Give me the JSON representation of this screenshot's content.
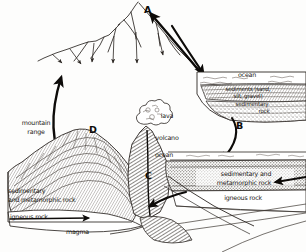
{
  "diagram": {
    "type": "hand-drawn geology cross-section",
    "stage": {
      "width": 306,
      "height": 252
    },
    "ink_color": "#191512",
    "paper_color": "#fdfdfc"
  },
  "keys": [
    {
      "id": "A",
      "label": "A",
      "x": 146,
      "y": 6,
      "desc": "erosion and transport of sediment to ocean"
    },
    {
      "id": "B",
      "label": "B",
      "x": 238,
      "y": 125,
      "desc": "burial and lithification into sedimentary rock"
    },
    {
      "id": "C",
      "label": "C",
      "x": 147,
      "y": 175,
      "desc": "subduction of crust toward magma"
    },
    {
      "id": "D",
      "label": "D",
      "x": 91,
      "y": 127,
      "desc": "uplift of mountain range"
    }
  ],
  "labels": [
    {
      "name": "ocean-upper",
      "text": "ocean",
      "x": 247,
      "y": 75,
      "size": "small",
      "align": "ctr"
    },
    {
      "name": "sediments",
      "text": "sediments (sand,",
      "x": 247,
      "y": 90,
      "size": "tiny",
      "align": "ctr"
    },
    {
      "name": "sediments-2",
      "text": "silt, gravel)",
      "x": 247,
      "y": 97,
      "size": "tiny",
      "align": "ctr"
    },
    {
      "name": "sedimentary-rock",
      "text": "sedimentary",
      "x": 250,
      "y": 106,
      "size": "tiny",
      "align": "ctr"
    },
    {
      "name": "sedimentary-rock2",
      "text": "rock",
      "x": 258,
      "y": 113,
      "size": "tiny",
      "align": "ctr"
    },
    {
      "name": "mountain-range",
      "text": "mountain",
      "x": 35,
      "y": 124,
      "size": "small",
      "align": "ctr"
    },
    {
      "name": "mountain-range-2",
      "text": "range",
      "x": 35,
      "y": 133,
      "size": "small",
      "align": "ctr"
    },
    {
      "name": "lava",
      "text": "lava",
      "x": 164,
      "y": 117,
      "size": "small",
      "align": "ctr"
    },
    {
      "name": "volcano",
      "text": "volcano",
      "x": 165,
      "y": 139,
      "size": "small",
      "align": "ctr"
    },
    {
      "name": "ocean-mid",
      "text": "ocean",
      "x": 163,
      "y": 156,
      "size": "small",
      "align": "ctr"
    },
    {
      "name": "sed-meta-right",
      "text": "sedimentary and",
      "x": 245,
      "y": 175,
      "size": "small",
      "align": "ctr"
    },
    {
      "name": "sed-meta-right-2",
      "text": "metamorphic rock",
      "x": 243,
      "y": 184,
      "size": "small",
      "align": "ctr"
    },
    {
      "name": "igneous-rock-right",
      "text": "igneous rock",
      "x": 242,
      "y": 199,
      "size": "small",
      "align": "ctr"
    },
    {
      "name": "sed-meta-left",
      "text": "sedimentary",
      "x": 44,
      "y": 192,
      "size": "small",
      "align": "ctr"
    },
    {
      "name": "sed-meta-left-2",
      "text": "and metamorphic rock",
      "x": 60,
      "y": 201,
      "size": "small",
      "align": "ctr"
    },
    {
      "name": "igneous-rock-left",
      "text": "igneous rock",
      "x": 42,
      "y": 218,
      "size": "small",
      "align": "ctr"
    },
    {
      "name": "magma",
      "text": "magma",
      "x": 88,
      "y": 233,
      "size": "small",
      "align": "ctr"
    }
  ]
}
